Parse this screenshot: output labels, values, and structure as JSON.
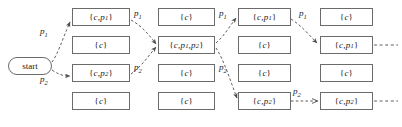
{
  "diagram": {
    "start_node": {
      "label": "start",
      "name": "start-node"
    },
    "colors": {
      "box_border": "#6b6b6b",
      "arrow": "#4d4d4d",
      "text": "#1a1a1a",
      "background": "#ffffff"
    },
    "columns": [
      {
        "index": 1,
        "nodes": [
          {
            "row": 1,
            "label": "{c, p1}",
            "html": "{<i>c</i>, <i>p</i><sub>1</sub>}"
          },
          {
            "row": 2,
            "label": "{c}",
            "html": "{<i>c</i>}"
          },
          {
            "row": 3,
            "label": "{c, p2}",
            "html": "{<i>c</i>, <i>p</i><sub>2</sub>}"
          },
          {
            "row": 4,
            "label": "{c}",
            "html": "{<i>c</i>}"
          }
        ]
      },
      {
        "index": 2,
        "nodes": [
          {
            "row": 1,
            "label": "{c}",
            "html": "{<i>c</i>}"
          },
          {
            "row": 2,
            "label": "{c, p1, p2}",
            "html": "{<i>c</i>, <i>p</i><sub>1</sub>, <i>p</i><sub>2</sub>}"
          },
          {
            "row": 3,
            "label": "{c}",
            "html": "{<i>c</i>}"
          },
          {
            "row": 4,
            "label": "{c}",
            "html": "{<i>c</i>}"
          }
        ]
      },
      {
        "index": 3,
        "nodes": [
          {
            "row": 1,
            "label": "{c, p1}",
            "html": "{<i>c</i>, <i>p</i><sub>1</sub>}"
          },
          {
            "row": 2,
            "label": "{c}",
            "html": "{<i>c</i>}"
          },
          {
            "row": 3,
            "label": "{c}",
            "html": "{<i>c</i>}"
          },
          {
            "row": 4,
            "label": "{c, p2}",
            "html": "{<i>c</i>, <i>p</i><sub>2</sub>}"
          }
        ]
      },
      {
        "index": 4,
        "nodes": [
          {
            "row": 1,
            "label": "{c}",
            "html": "{<i>c</i>}"
          },
          {
            "row": 2,
            "label": "{c, p1}",
            "html": "{<i>c</i>, <i>p</i><sub>1</sub>}"
          },
          {
            "row": 3,
            "label": "{c}",
            "html": "{<i>c</i>}"
          },
          {
            "row": 4,
            "label": "{c, p2}",
            "html": "{<i>c</i>, <i>p</i><sub>2</sub>}"
          }
        ]
      }
    ],
    "edge_labels": [
      {
        "id": "e1",
        "label": "p1",
        "html": "<i>p</i><sub>1</sub>",
        "x": 40,
        "y": 26
      },
      {
        "id": "e2",
        "label": "p2",
        "html": "<i>p</i><sub>2</sub>",
        "x": 40,
        "y": 74
      },
      {
        "id": "e3",
        "label": "p1",
        "html": "<i>p</i><sub>1</sub>",
        "x": 134,
        "y": 8
      },
      {
        "id": "e4",
        "label": "p2",
        "html": "<i>p</i><sub>2</sub>",
        "x": 134,
        "y": 62
      },
      {
        "id": "e5",
        "label": "p1",
        "html": "<i>p</i><sub>1</sub>",
        "x": 219,
        "y": 8
      },
      {
        "id": "e6",
        "label": "p2",
        "html": "<i>p</i><sub>2</sub>",
        "x": 219,
        "y": 62
      },
      {
        "id": "e7",
        "label": "p1",
        "html": "<i>p</i><sub>1</sub>",
        "x": 299,
        "y": 8
      },
      {
        "id": "e8",
        "label": "p2",
        "html": "<i>p</i><sub>2</sub>",
        "x": 293,
        "y": 86
      }
    ]
  }
}
